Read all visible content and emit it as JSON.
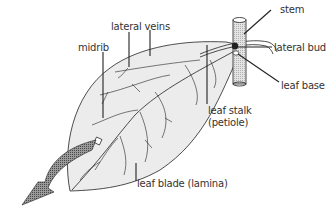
{
  "diagram": {
    "labels": {
      "stem": "stem",
      "lateral_bud": "lateral bud",
      "leaf_base": "leaf base",
      "lateral_veins": "lateral veins",
      "midrib": "midrib",
      "leaf_stalk_line1": "leaf stalk",
      "leaf_stalk_line2": "(petiole)",
      "leaf_blade": "leaf blade (lamina)"
    },
    "colors": {
      "line": "#222222",
      "leaf_fill": "#ececec",
      "stem_fill": "#d8d8d8",
      "arrow_fill": "#6a6a6a",
      "text": "#333333"
    }
  }
}
